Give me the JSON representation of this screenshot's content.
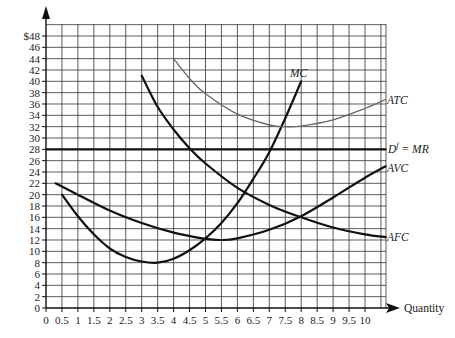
{
  "chart_data": {
    "type": "line",
    "title": "",
    "xlabel": "Quantity",
    "ylabel": "$",
    "xlim": [
      0,
      10.65
    ],
    "ylim": [
      0,
      50
    ],
    "grid": true,
    "x_ticks": [
      "0",
      "0.5",
      "1",
      "1.5",
      "2",
      "2.5",
      "3",
      "3.5",
      "4",
      "4.5",
      "5",
      "5.5",
      "6",
      "6.5",
      "7",
      "7.5",
      "8",
      "8.5",
      "9",
      "9.5",
      "10"
    ],
    "y_ticks": [
      "0",
      "2",
      "4",
      "6",
      "8",
      "10",
      "12",
      "14",
      "16",
      "18",
      "20",
      "22",
      "24",
      "26",
      "28",
      "30",
      "32",
      "34",
      "36",
      "38",
      "40",
      "42",
      "44",
      "46",
      "$48"
    ],
    "series": [
      {
        "name": "MC",
        "color": "#111111",
        "width": 2.2,
        "points": [
          [
            0.5,
            20
          ],
          [
            1,
            16.2
          ],
          [
            1.5,
            13
          ],
          [
            2,
            10.5
          ],
          [
            2.5,
            9
          ],
          [
            3,
            8.2
          ],
          [
            3.5,
            8
          ],
          [
            4,
            8.7
          ],
          [
            4.5,
            10.2
          ],
          [
            5,
            12.3
          ],
          [
            5.5,
            15
          ],
          [
            6,
            18.5
          ],
          [
            6.5,
            22.8
          ],
          [
            7,
            27.5
          ],
          [
            7.5,
            33.5
          ],
          [
            8,
            40
          ]
        ]
      },
      {
        "name": "AVC",
        "color": "#111111",
        "width": 2.2,
        "points": [
          [
            0.3,
            22
          ],
          [
            1,
            20
          ],
          [
            2,
            17.2
          ],
          [
            3,
            15
          ],
          [
            4,
            13.3
          ],
          [
            5,
            12.2
          ],
          [
            5.5,
            12
          ],
          [
            6,
            12.3
          ],
          [
            7,
            13.8
          ],
          [
            8,
            16.2
          ],
          [
            9,
            19.5
          ],
          [
            10,
            23
          ],
          [
            10.65,
            25
          ]
        ]
      },
      {
        "name": "AFC",
        "color": "#111111",
        "width": 2.2,
        "points": [
          [
            3,
            41
          ],
          [
            3.5,
            35.5
          ],
          [
            4,
            31.5
          ],
          [
            4.5,
            28.2
          ],
          [
            5,
            25.5
          ],
          [
            6,
            21.2
          ],
          [
            7,
            18.2
          ],
          [
            8,
            16
          ],
          [
            9,
            14.2
          ],
          [
            10,
            13
          ],
          [
            10.65,
            12.5
          ]
        ]
      },
      {
        "name": "ATC",
        "color": "#666666",
        "width": 1.3,
        "points": [
          [
            4,
            44
          ],
          [
            4.5,
            40.5
          ],
          [
            5,
            37.8
          ],
          [
            6,
            34.2
          ],
          [
            7,
            32.3
          ],
          [
            7.5,
            32
          ],
          [
            8,
            32.1
          ],
          [
            9,
            33.2
          ],
          [
            10,
            35.2
          ],
          [
            10.65,
            36.8
          ]
        ]
      },
      {
        "name": "Df = MR",
        "color": "#111111",
        "width": 2.2,
        "points": [
          [
            0,
            28
          ],
          [
            10.65,
            28
          ]
        ]
      }
    ],
    "annotations": [
      {
        "text": "MC",
        "x": 7.7,
        "y": 41.5
      },
      {
        "text": "ATC",
        "x": 10.7,
        "y": 37
      },
      {
        "text": "Df = MR",
        "x": 10.7,
        "y": 28
      },
      {
        "text": "AVC",
        "x": 10.7,
        "y": 25
      },
      {
        "text": "AFC",
        "x": 10.7,
        "y": 12.5
      }
    ]
  },
  "labels": {
    "mc": "MC",
    "atc": "ATC",
    "d_main": "D",
    "d_sup": "f",
    "d_rest": " = MR",
    "avc": "AVC",
    "afc": "AFC",
    "quantity": "Quantity"
  }
}
